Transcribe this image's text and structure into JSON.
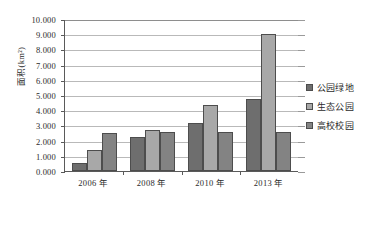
{
  "chart_data": {
    "type": "bar",
    "title": "",
    "xlabel": "",
    "ylabel": "面积(km²)",
    "categories": [
      "2006 年",
      "2008 年",
      "2010 年",
      "2013 年"
    ],
    "series": [
      {
        "name": "公园绿地",
        "color": "#6e6e6e",
        "values": [
          0.55,
          2.22,
          3.15,
          4.74
        ]
      },
      {
        "name": "生态公园",
        "color": "#a8a8a8",
        "values": [
          1.4,
          2.73,
          4.32,
          9.04
        ]
      },
      {
        "name": "高校校园",
        "color": "#838383",
        "values": [
          2.5,
          2.54,
          2.56,
          2.56
        ]
      }
    ],
    "ylim": [
      0,
      10
    ],
    "ytick_values": [
      0,
      1,
      2,
      3,
      4,
      5,
      6,
      7,
      8,
      9,
      10
    ],
    "ytick_labels": [
      "0.000",
      "1.000",
      "2.000",
      "3.000",
      "4.000",
      "5.000",
      "6.000",
      "7.000",
      "8.000",
      "9.000",
      "10.000"
    ],
    "grid": true,
    "legend_position": "right"
  },
  "colors": {
    "axis": "#5a5a5a",
    "grid": "#b9b9b9",
    "background": "#ffffff",
    "bar_outline": "#4d4d4d"
  }
}
